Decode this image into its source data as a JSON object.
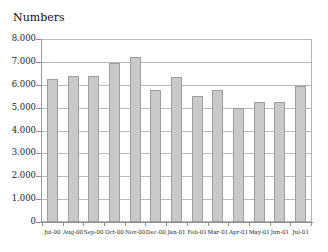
{
  "chart_data": {
    "type": "bar",
    "title": "Numbers",
    "xlabel": "",
    "ylabel": "",
    "ylim": [
      0,
      8000
    ],
    "ytick_labels": [
      "8.000",
      "7.000",
      "6.000",
      "5.000",
      "4.000",
      "3.000",
      "2.000",
      "1.000",
      "0"
    ],
    "ytick_values": [
      8000,
      7000,
      6000,
      5000,
      4000,
      3000,
      2000,
      1000,
      0
    ],
    "grid": true,
    "legend": false,
    "categories": [
      "Jul-00",
      "Aug-00",
      "Sep-00",
      "Oct-00",
      "Nov-00",
      "Dec-00",
      "Jan-01",
      "Feb-01",
      "Mar-01",
      "Apr-01",
      "May-01",
      "Jun-01",
      "Jul-01"
    ],
    "values": [
      6290,
      6420,
      6440,
      7000,
      7250,
      5810,
      6380,
      5540,
      5810,
      5020,
      5270,
      5280,
      6000
    ],
    "bar_color": "#c9c9c9",
    "bar_border_color": "#9d9d9d",
    "grid_color": "#b9b9b9",
    "axis_color": "#8f8f8f",
    "text_color": "#1a1a1a",
    "background": "#ffffff"
  }
}
